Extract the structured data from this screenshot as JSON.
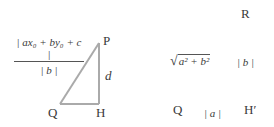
{
  "diagram": {
    "left_triangle": {
      "vertices": {
        "P": "P",
        "Q": "Q",
        "H": "H"
      },
      "side_label": "d",
      "line_color": "#aaaaaa"
    },
    "formula": {
      "numerator": "| ax₀ + by₀ + c |",
      "denominator": "| b |"
    },
    "right_figure": {
      "vertices": {
        "R": "R",
        "Q": "Q",
        "H_prime": "H′"
      },
      "hypotenuse_label": "a² + b²",
      "vertical_label": "| b |",
      "horizontal_label": "| a |"
    }
  }
}
